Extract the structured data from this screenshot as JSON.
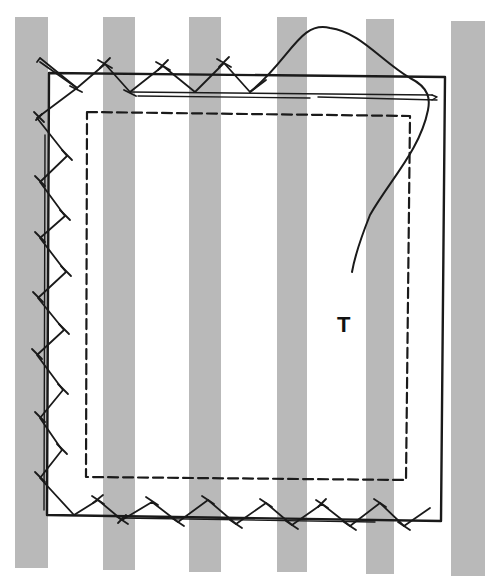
{
  "figure": {
    "type": "sewing-illustration",
    "background_color": "#ffffff",
    "stripe_color": "#b9b9b9",
    "line_color": "#1a1a1a",
    "stripes": [
      {
        "x": 15,
        "w": 33
      },
      {
        "x": 103,
        "w": 32
      },
      {
        "x": 189,
        "w": 32
      },
      {
        "x": 277,
        "w": 30
      },
      {
        "x": 366,
        "w": 28
      },
      {
        "x": 451,
        "w": 34
      }
    ],
    "labels": {
      "thread_label": "T"
    },
    "elements": {
      "patch_outline": "solid rectangle (patch edge)",
      "seam_guide": "dashed rectangle (inner stitching guide)",
      "stitches": "herringbone cross-stitches along top, left and bottom edges",
      "needle": "needle inserted along top edge",
      "thread": "loose thread curving from needle, ending near label T"
    }
  }
}
